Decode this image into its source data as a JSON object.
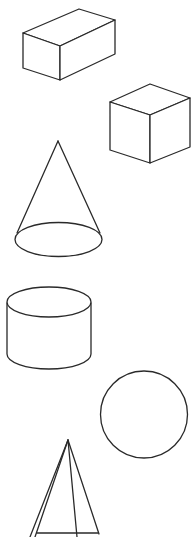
{
  "figure": {
    "stroke_color": "#2a2a2a",
    "background": "#ffffff",
    "shapes": [
      {
        "name": "rectangular-prism",
        "label": "Rectangular prism (cuboid)"
      },
      {
        "name": "cube",
        "label": "Cube"
      },
      {
        "name": "cone",
        "label": "Cone"
      },
      {
        "name": "cylinder",
        "label": "Cylinder"
      },
      {
        "name": "sphere",
        "label": "Sphere"
      },
      {
        "name": "pyramid",
        "label": "Pyramid"
      }
    ]
  }
}
